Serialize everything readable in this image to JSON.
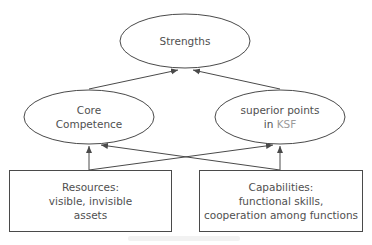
{
  "diagram": {
    "colors": {
      "stroke": "#4a4a4a",
      "text": "#505050",
      "accent_text": "#9a9a9a",
      "background": "#ffffff"
    },
    "nodes": {
      "strengths": {
        "shape": "ellipse",
        "lines": [
          "Strengths"
        ]
      },
      "core_competence": {
        "shape": "ellipse",
        "lines": [
          "Core",
          "Competence"
        ]
      },
      "superior_points": {
        "shape": "ellipse",
        "line1": "superior points",
        "line2_prefix": "in ",
        "line2_accent": "KSF"
      },
      "resources": {
        "shape": "rectangle",
        "lines": [
          "Resources:",
          "visible, invisible",
          "assets"
        ]
      },
      "capabilities": {
        "shape": "rectangle",
        "lines": [
          "Capabilities:",
          "functional skills,",
          "cooperation among functions"
        ]
      }
    },
    "edges": [
      {
        "from": "core_competence",
        "to": "strengths"
      },
      {
        "from": "superior_points",
        "to": "strengths"
      },
      {
        "from": "resources",
        "to": "core_competence"
      },
      {
        "from": "resources",
        "to": "superior_points"
      },
      {
        "from": "capabilities",
        "to": "core_competence"
      },
      {
        "from": "capabilities",
        "to": "superior_points"
      }
    ]
  }
}
